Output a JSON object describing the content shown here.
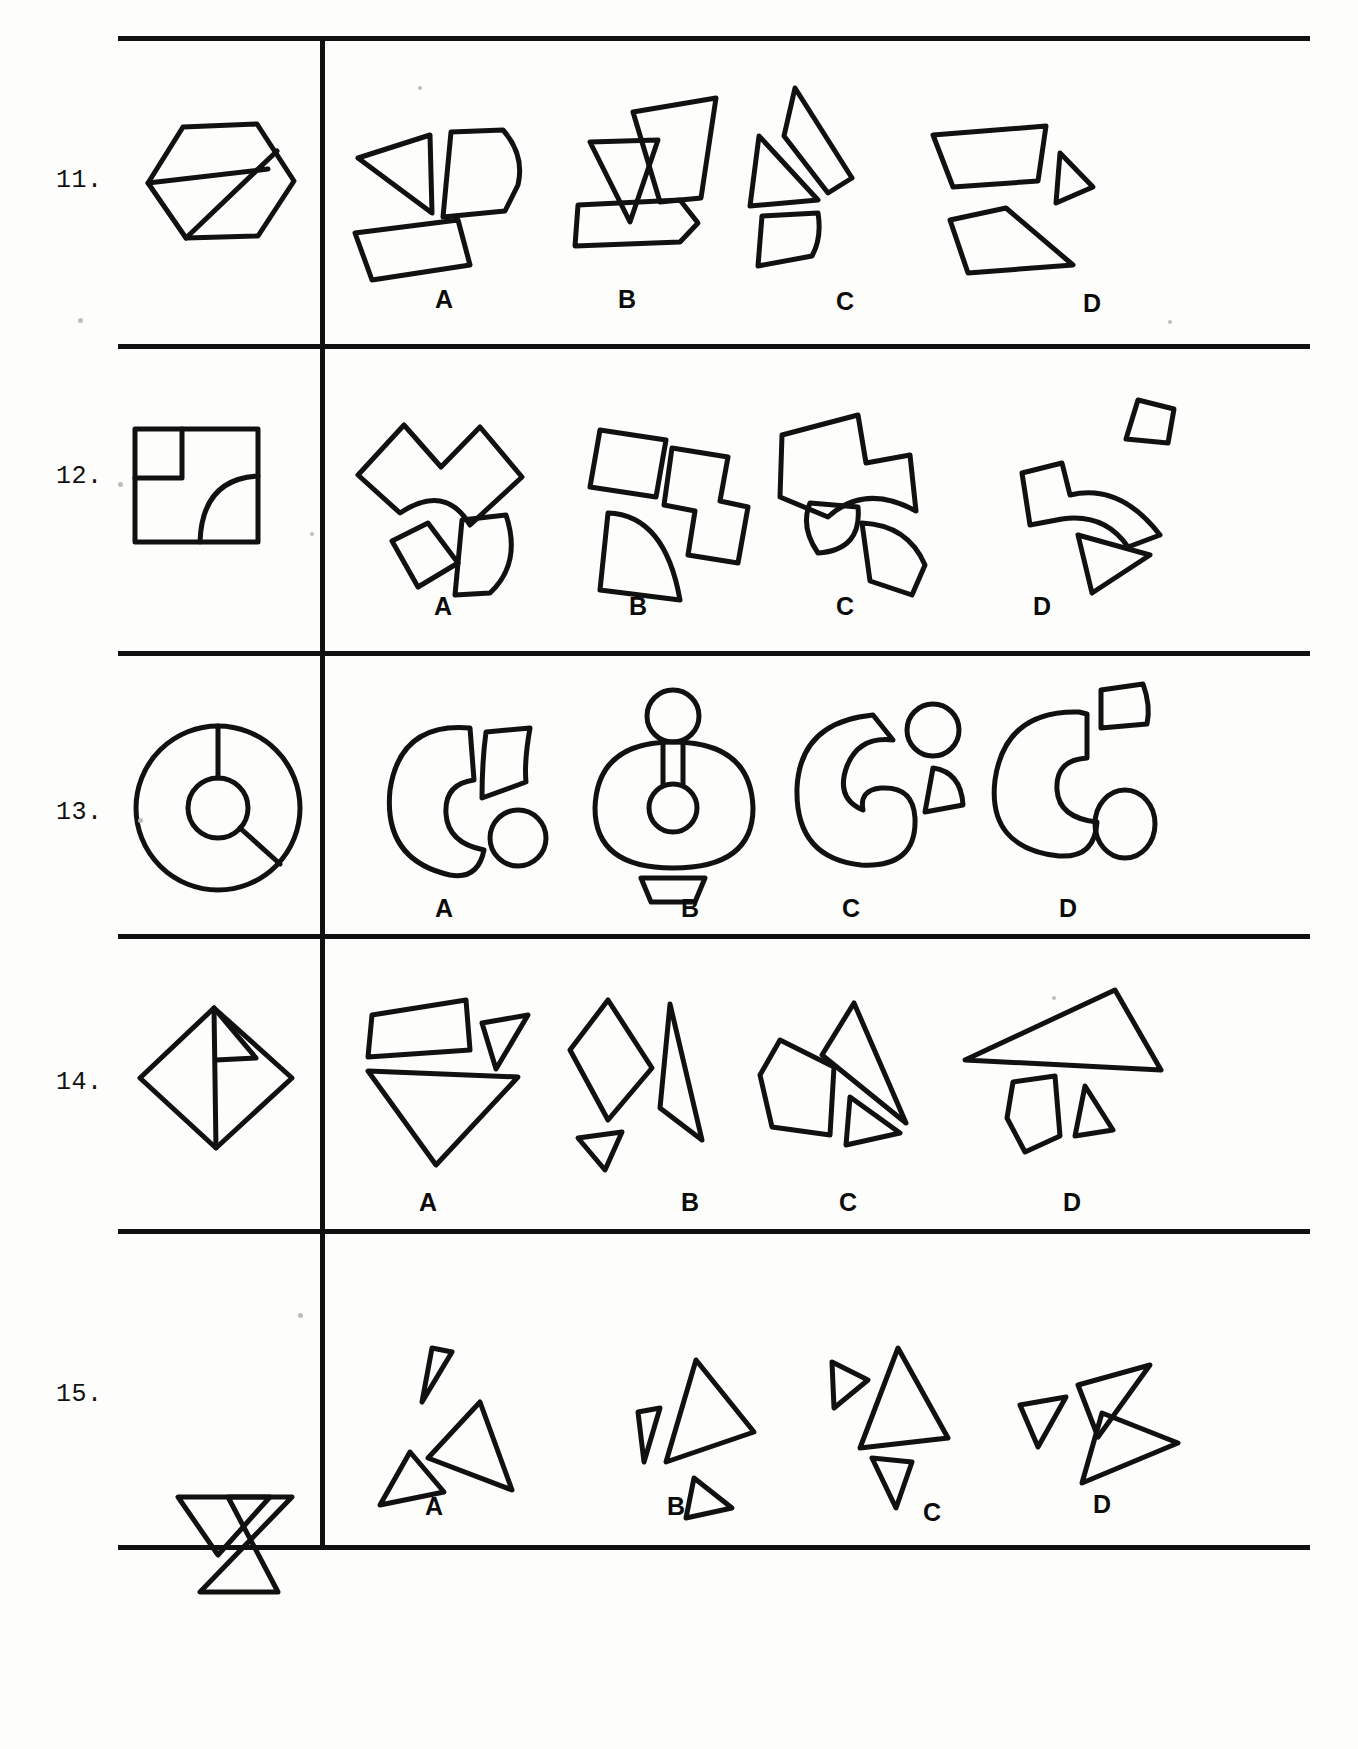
{
  "document": {
    "type": "spatial-reasoning-test-page",
    "description": "Form board / figure assembly test page showing five problems numbered 11 through 15. Each row shows one complete outlined figure at the left and four lettered answer choices of disassembled pieces at the right.",
    "option_letters": [
      "A",
      "B",
      "C",
      "D"
    ]
  },
  "rows": [
    {
      "number": "11.",
      "prompt_figure": "hexagon divided by two internal lines into three pieces",
      "options": [
        {
          "letter": "A",
          "pieces": "triangle, D-shaped piece, rectangle"
        },
        {
          "letter": "B",
          "pieces": "small triangle, parallelogram, pentagon"
        },
        {
          "letter": "C",
          "pieces": "triangle, elongated triangle, quadrilateral"
        },
        {
          "letter": "D",
          "pieces": "trapezoid, small triangle, pentagon"
        }
      ]
    },
    {
      "number": "12.",
      "prompt_figure": "square with a small square notch at upper-left and a quarter-circle arc at lower-right",
      "options": [
        {
          "letter": "A",
          "pieces": "notched arc block, small square, quarter-disc"
        },
        {
          "letter": "B",
          "pieces": "square, stepped block, quarter-disc"
        },
        {
          "letter": "C",
          "pieces": "notched block, small quarter-disc, curved sliver"
        },
        {
          "letter": "D",
          "pieces": "small triangle, curved arc piece, triangle"
        }
      ]
    },
    {
      "number": "13.",
      "prompt_figure": "circle with concentric inner circle and two radial dividing lines",
      "options": [
        {
          "letter": "A",
          "pieces": "large C-shaped annulus, curved wedge, small circle"
        },
        {
          "letter": "B",
          "pieces": "circle with small circle on top, small trapezoid"
        },
        {
          "letter": "C",
          "pieces": "thick C crescent, curved wedge"
        },
        {
          "letter": "D",
          "pieces": "C-shaped annulus, curved cap, small oval"
        }
      ]
    },
    {
      "number": "14.",
      "prompt_figure": "square rotated 45 degrees (diamond) divided into three pieces by two internal lines",
      "options": [
        {
          "letter": "A",
          "pieces": "quadrilateral, small triangle, large triangle"
        },
        {
          "letter": "B",
          "pieces": "quadrilateral, elongated triangle, small triangle"
        },
        {
          "letter": "C",
          "pieces": "pentagon, large triangle, small triangle"
        },
        {
          "letter": "D",
          "pieces": "large triangle, quadrilateral, small triangle"
        }
      ]
    },
    {
      "number": "15.",
      "prompt_figure": "bowtie / hourglass made of two triangles sharing a common top edge",
      "options": [
        {
          "letter": "A",
          "pieces": "small triangle, large triangle, medium triangle"
        },
        {
          "letter": "B",
          "pieces": "small triangle, large triangle, small triangle"
        },
        {
          "letter": "C",
          "pieces": "small triangle, large triangle, small triangle"
        },
        {
          "letter": "D",
          "pieces": "small triangle, large triangle, small triangle"
        }
      ]
    }
  ],
  "colors": {
    "ink": "#111111",
    "paper": "#fdfdfb"
  }
}
